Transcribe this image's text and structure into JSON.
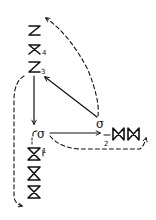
{
  "diagram": {
    "type": "hand-drawn knitting/knot symbol diagram",
    "stroke_color": "#111111",
    "background": "#ffffff",
    "top_column": {
      "symbols": [
        {
          "glyph": "bowtie",
          "label": ""
        },
        {
          "glyph": "bowtie",
          "label": "4"
        },
        {
          "glyph": "bowtie",
          "label": "3"
        }
      ]
    },
    "bottom_column": {
      "symbols": [
        {
          "glyph": "bowtie",
          "label": "1"
        },
        {
          "glyph": "bowtie",
          "label": ""
        },
        {
          "glyph": "bowtie",
          "label": ""
        }
      ]
    },
    "right_row": {
      "symbols": [
        {
          "glyph": "bowtie",
          "label": "2"
        },
        {
          "glyph": "bowtie",
          "label": ""
        }
      ]
    },
    "nodes": [
      {
        "id": "loop-left",
        "glyph": "σ"
      },
      {
        "id": "loop-right",
        "glyph": "σ"
      }
    ],
    "labels": {
      "l1": "1",
      "l2": "2",
      "l3": "3",
      "l4": "4",
      "sigma_left": "σ",
      "sigma_right": "σ"
    },
    "edges": [
      {
        "from": "3",
        "to": "loop-left",
        "style": "solid",
        "arrow": true
      },
      {
        "from": "loop-right",
        "to": "3",
        "style": "solid",
        "arrow": true
      },
      {
        "from": "loop-left",
        "to": "2",
        "style": "solid",
        "arrow": true
      },
      {
        "from": "loop-right",
        "to": "top",
        "style": "dashed",
        "arrow": true
      },
      {
        "from": "3",
        "to": "bottom-left",
        "style": "dashed",
        "arrow": true
      },
      {
        "from": "loop-left",
        "to": "right-end",
        "style": "dashed",
        "arrow": true
      }
    ]
  }
}
